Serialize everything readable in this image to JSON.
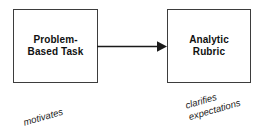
{
  "diagram": {
    "type": "flow",
    "background_color": "#ffffff",
    "stroke_color": "#3d3d3d",
    "text_color": "#111111",
    "nodes": [
      {
        "id": "problem-based-task",
        "label": "Problem-\nBased Task",
        "shape": "rectangle",
        "x": 13,
        "y": 9,
        "width": 85,
        "height": 74
      },
      {
        "id": "analytic-rubric",
        "label": "Analytic\nRubric",
        "shape": "rectangle",
        "x": 167,
        "y": 9,
        "width": 84,
        "height": 74
      }
    ],
    "edges": [
      {
        "id": "task-to-rubric",
        "from": "problem-based-task",
        "to": "analytic-rubric",
        "arrowhead": "filled-triangle",
        "direction": "right"
      }
    ],
    "annotations": [
      {
        "id": "motivates",
        "text": "motivates",
        "style": "italic",
        "rotation_deg": -16
      },
      {
        "id": "clarifies-expectations",
        "text": "clarifies\nexpectations",
        "style": "italic",
        "rotation_deg": -16
      }
    ]
  }
}
